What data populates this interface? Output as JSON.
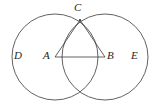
{
  "figure": {
    "background_color": "#ffffff",
    "stroke_color": "#3a3a3a",
    "label_color": "#262626",
    "stroke_width": 0.8,
    "width": 160,
    "height": 111
  },
  "points": {
    "A": {
      "label": "A",
      "x": 55,
      "y": 57,
      "role": "center-left-circle"
    },
    "B": {
      "label": "B",
      "x": 105,
      "y": 57,
      "role": "center-right-circle"
    },
    "C": {
      "label": "C",
      "x": 80,
      "y": 20,
      "role": "upper-intersection"
    },
    "D": {
      "label": "D",
      "x": 18,
      "y": 57,
      "role": "left-circle-region"
    },
    "E": {
      "label": "E",
      "x": 136,
      "y": 57,
      "role": "right-circle-region"
    },
    "F": {
      "label": "",
      "x": 80,
      "y": 94,
      "role": "lower-intersection"
    }
  },
  "labels": [
    {
      "text": "C",
      "left": 74,
      "top": 2
    },
    {
      "text": "D",
      "left": 14,
      "top": 50
    },
    {
      "text": "A",
      "left": 43,
      "top": 50
    },
    {
      "text": "B",
      "left": 107,
      "top": 50
    },
    {
      "text": "E",
      "left": 131,
      "top": 50
    }
  ],
  "circles": [
    {
      "name": "left-circle",
      "cx": 55,
      "cy": 57,
      "r": 43
    },
    {
      "name": "right-circle",
      "cx": 105,
      "cy": 57,
      "r": 43
    }
  ],
  "segments": [
    {
      "name": "segment-AB",
      "x1": 55,
      "y1": 57,
      "x2": 105,
      "y2": 57
    },
    {
      "name": "segment-AC",
      "x1": 55,
      "y1": 57,
      "x2": 80,
      "y2": 20
    },
    {
      "name": "segment-BC",
      "x1": 105,
      "y1": 57,
      "x2": 80,
      "y2": 20
    }
  ]
}
